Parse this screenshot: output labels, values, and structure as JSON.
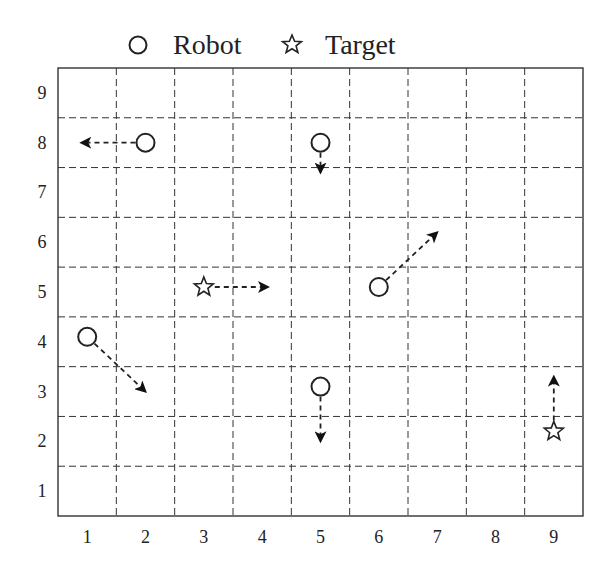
{
  "legend": {
    "robot_label": "Robot",
    "target_label": "Target",
    "robot_icon": "circle-icon",
    "target_icon": "star-icon"
  },
  "grid": {
    "columns": 9,
    "rows": 9,
    "x_labels": [
      "1",
      "2",
      "3",
      "4",
      "5",
      "6",
      "7",
      "8",
      "9"
    ],
    "y_labels": [
      "1",
      "2",
      "3",
      "4",
      "5",
      "6",
      "7",
      "8",
      "9"
    ],
    "line_style": "dashed"
  },
  "colors": {
    "ink": "#222222",
    "background": "#ffffff"
  },
  "agents": [
    {
      "type": "robot",
      "x": 2.0,
      "y": 8.0,
      "move_to": {
        "x": 0.9,
        "y": 8.0
      },
      "direction": "left"
    },
    {
      "type": "robot",
      "x": 5.0,
      "y": 8.0,
      "move_to": {
        "x": 5.0,
        "y": 7.4
      },
      "direction": "down"
    },
    {
      "type": "robot",
      "x": 6.0,
      "y": 5.1,
      "move_to": {
        "x": 7.0,
        "y": 6.2
      },
      "direction": "up-right"
    },
    {
      "type": "robot",
      "x": 1.0,
      "y": 4.1,
      "move_to": {
        "x": 2.0,
        "y": 3.0
      },
      "direction": "down-right"
    },
    {
      "type": "robot",
      "x": 5.0,
      "y": 3.1,
      "move_to": {
        "x": 5.0,
        "y": 2.0
      },
      "direction": "down"
    },
    {
      "type": "target",
      "x": 3.0,
      "y": 5.1,
      "move_to": {
        "x": 4.1,
        "y": 5.1
      },
      "direction": "right"
    },
    {
      "type": "target",
      "x": 9.0,
      "y": 2.2,
      "move_to": {
        "x": 9.0,
        "y": 3.3
      },
      "direction": "up"
    }
  ]
}
